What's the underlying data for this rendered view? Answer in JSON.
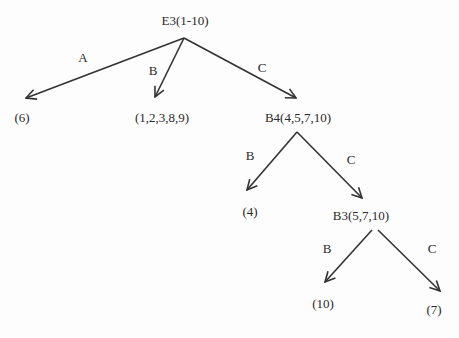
{
  "diagram": {
    "type": "decision-tree",
    "nodes": {
      "root": {
        "label": "E3(1-10)"
      },
      "leaf_a": {
        "label": "(6)"
      },
      "leaf_b": {
        "label": "(1,2,3,8,9)"
      },
      "b4": {
        "label": "B4(4,5,7,10)"
      },
      "b4_leaf_b": {
        "label": "(4)"
      },
      "b3": {
        "label": "B3(5,7,10)"
      },
      "b3_leaf_b": {
        "label": "(10)"
      },
      "b3_leaf_c": {
        "label": "(7)"
      }
    },
    "edges": {
      "root_a": {
        "label": "A",
        "from": "E3(1-10)",
        "to": "(6)"
      },
      "root_b": {
        "label": "B",
        "from": "E3(1-10)",
        "to": "(1,2,3,8,9)"
      },
      "root_c": {
        "label": "C",
        "from": "E3(1-10)",
        "to": "B4(4,5,7,10)"
      },
      "b4_b": {
        "label": "B",
        "from": "B4(4,5,7,10)",
        "to": "(4)"
      },
      "b4_c": {
        "label": "C",
        "from": "B4(4,5,7,10)",
        "to": "B3(5,7,10)"
      },
      "b3_b": {
        "label": "B",
        "from": "B3(5,7,10)",
        "to": "(10)"
      },
      "b3_c": {
        "label": "C",
        "from": "B3(5,7,10)",
        "to": "(7)"
      }
    },
    "colors": {
      "line": "#333333",
      "text": "#2a2a2a",
      "background": "#fdfdfd"
    }
  }
}
